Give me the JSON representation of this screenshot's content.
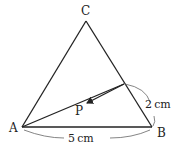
{
  "diagram": {
    "type": "geometry",
    "shape": "triangle",
    "vertices": {
      "A": "A",
      "B": "B",
      "C": "C",
      "P": "P"
    },
    "dimensions": {
      "AB": "5 cm",
      "segment_on_CB": "2 cm"
    },
    "colors": {
      "line": "#222222",
      "background": "#ffffff"
    }
  }
}
